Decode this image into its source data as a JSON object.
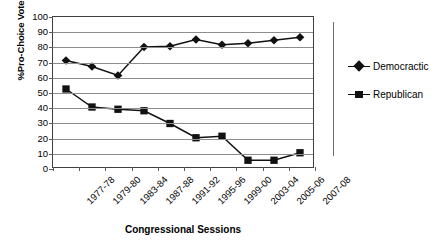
{
  "chart_data": {
    "type": "line",
    "title": "",
    "xlabel": "Congressional Sessions",
    "ylabel": "%Pro-Choice Vote",
    "ylim": [
      0,
      100
    ],
    "yticks": [
      0,
      10,
      20,
      30,
      40,
      50,
      60,
      70,
      80,
      90,
      100
    ],
    "grid": true,
    "legend_position": "right",
    "categories": [
      "1977-78",
      "1979-80",
      "1983-84",
      "1987-88",
      "1991-92",
      "1995-96",
      "1999-00",
      "2003-04",
      "2005-06",
      "2007-08"
    ],
    "series": [
      {
        "name": "Democractic",
        "marker": "diamond",
        "color": "#111111",
        "values": [
          71,
          67,
          61,
          80,
          80.5,
          85,
          81.5,
          82.5,
          84.5,
          86.5
        ]
      },
      {
        "name": "Republican",
        "marker": "square",
        "color": "#111111",
        "values": [
          52,
          40,
          38.5,
          37.5,
          29,
          19.5,
          20.5,
          4.5,
          4.5,
          9.5
        ]
      }
    ]
  },
  "legend": {
    "entries": [
      {
        "label": "Democractic",
        "marker": "diamond"
      },
      {
        "label": "Republican",
        "marker": "square"
      }
    ]
  },
  "colors": {
    "series": "#111111",
    "gridline": "#8d8d8d",
    "axis": "#3f3f3f",
    "background": "#ffffff"
  }
}
